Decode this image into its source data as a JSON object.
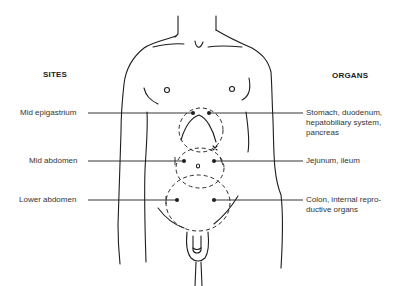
{
  "headings": {
    "sites": "SITES",
    "organs": "ORGANS"
  },
  "sites": [
    {
      "label": "Mid epigastrium"
    },
    {
      "label": "Mid abdomen"
    },
    {
      "label": "Lower abdomen"
    }
  ],
  "organs": [
    {
      "line1": "Stomach, duodenum,",
      "line2": "hepatobiliary system,",
      "line3": "pancreas"
    },
    {
      "line1": "Jejunum, ileum"
    },
    {
      "line1": "Colon, internal repro-",
      "line2": "ductive organs"
    }
  ],
  "figure": {
    "regions": [
      "mid-epigastrium-circle",
      "mid-abdomen-circle",
      "lower-abdomen-circle"
    ],
    "markers": [
      "umbilicus-o",
      "xiphoid-x"
    ]
  }
}
